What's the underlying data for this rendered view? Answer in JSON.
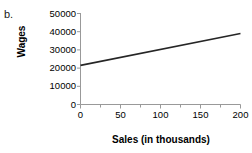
{
  "panel": {
    "label": "b."
  },
  "chart_data": {
    "type": "line",
    "title": "",
    "xlabel": "Sales (in thousands)",
    "ylabel": "Wages",
    "xlim": [
      0,
      200
    ],
    "ylim": [
      0,
      50000
    ],
    "grid": false,
    "legend": null,
    "x_ticks": [
      0,
      50,
      100,
      150,
      200
    ],
    "x_tick_labels": [
      "0",
      "50",
      "100",
      "150",
      "200"
    ],
    "x_minor_ticks": [
      25,
      75,
      125,
      175
    ],
    "y_ticks": [
      0,
      10000,
      20000,
      30000,
      40000,
      50000
    ],
    "y_tick_labels": [
      "0",
      "10000",
      "20000",
      "30000",
      "40000",
      "50000"
    ],
    "line_color": "#262626",
    "axis_color": "#999999",
    "series": [
      {
        "name": "Wages vs Sales",
        "x": [
          0,
          200
        ],
        "values": [
          21500,
          39000
        ]
      }
    ]
  }
}
